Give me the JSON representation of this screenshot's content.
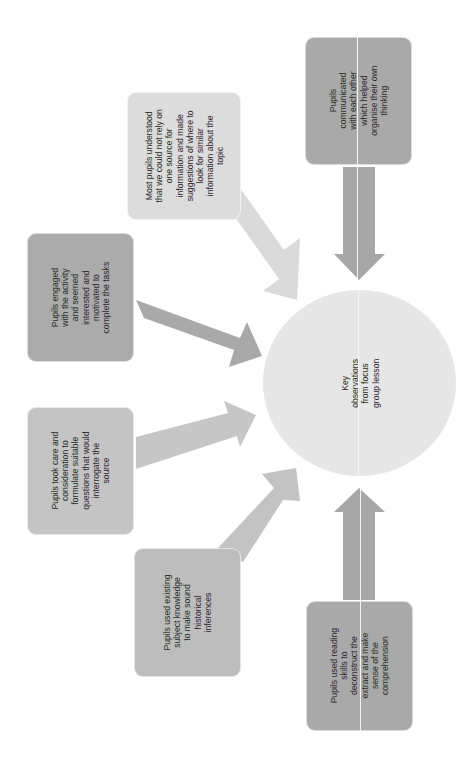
{
  "diagram": {
    "title": "Key observations from focus group lesson",
    "orientation": "rotated-90-ccw",
    "center": {
      "label": "Key\nobservations\nfrom focus\ngroup lesson",
      "color": "#e6e6e6"
    },
    "nodes": [
      {
        "id": "communicated",
        "label": "Pupils\ncommunicated\nwith each other\nwhich helped\norganise their own\nthinking",
        "color": "#a9a9a9"
      },
      {
        "id": "understood",
        "label": "Most pupils understood\nthat we could not rely on\none source for\ninformation and made\nsuggestions of where to\nlook for similar\ninformation about the\ntopic",
        "color": "#dcdcdc"
      },
      {
        "id": "engaged",
        "label": "Pupils engaged\nwith the activity\nand seemed\ninterested and\nmotivated to\ncomplete the tasks",
        "color": "#ababab"
      },
      {
        "id": "took-care",
        "label": "Pupils took care and\nconsideration to\nformulate suitable\nquestions that would\ninterrogate the\nsource",
        "color": "#c4c4c4"
      },
      {
        "id": "existing-knowledge",
        "label": "Pupils used existing\nsubject knowledge\nto make sound\nhistorical\ninferences",
        "color": "#bdbdbd"
      },
      {
        "id": "reading-skills",
        "label": "Pupils used reading\nskills to\ndeconstruct the\nextract and make\nsense of the\ncomprehension",
        "color": "#a9a9a9"
      }
    ],
    "arrow_colors": {
      "communicated": "#a7a7a7",
      "understood": "#dadada",
      "engaged": "#a9a9a9",
      "took-care": "#c6c6c6",
      "existing-knowledge": "#c3c3c3",
      "reading-skills": "#a7a7a7"
    }
  }
}
